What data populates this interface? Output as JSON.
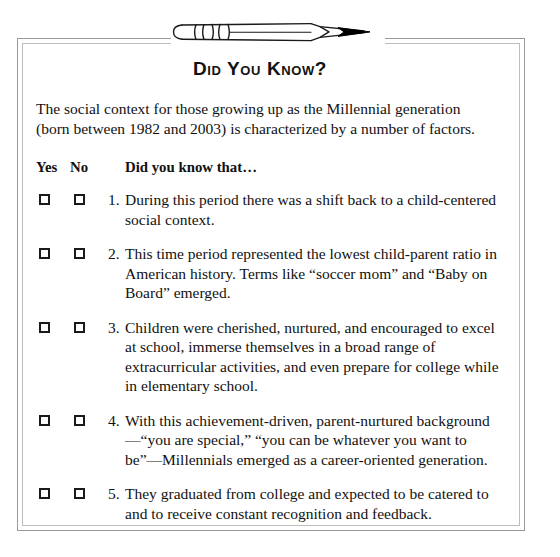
{
  "document": {
    "title": "Did You Know?",
    "intro": "The social context for those growing up as the Millennial generation (born between 1982 and 2003) is characterized by a number of factors.",
    "illustration": "pencil-drawing"
  },
  "table": {
    "headers": {
      "yes": "Yes",
      "no": "No",
      "question": "Did you know that…"
    },
    "rows": [
      {
        "number": "1.",
        "yes_checked": false,
        "no_checked": false,
        "text": "During this period there was a shift back to a child-centered social context."
      },
      {
        "number": "2.",
        "yes_checked": false,
        "no_checked": false,
        "text": "This time period represented the lowest child-parent ratio in American history. Terms like “soccer mom” and “Baby on Board” emerged."
      },
      {
        "number": "3.",
        "yes_checked": false,
        "no_checked": false,
        "text": "Children were cherished, nurtured, and encouraged to excel at school, immerse themselves in a broad range of extracurricular activities, and even prepare for college while in elementary school."
      },
      {
        "number": "4.",
        "yes_checked": false,
        "no_checked": false,
        "text": "With this achievement-driven, parent-nurtured background—“you are special,” “you can be whatever you want to be”—Millennials emerged as a career-oriented generation."
      },
      {
        "number": "5.",
        "yes_checked": false,
        "no_checked": false,
        "text": "They graduated from college and expected to be catered to and to receive constant recognition and feedback."
      }
    ]
  },
  "colors": {
    "page_background": "#ffffff",
    "text": "#111111",
    "frame_outer": "#9a9a9a",
    "frame_inner": "#bdbdbd",
    "checkbox_border": "#1a1a1a",
    "pencil_stroke": "#1a1a1a",
    "pencil_tip": "#000000"
  }
}
